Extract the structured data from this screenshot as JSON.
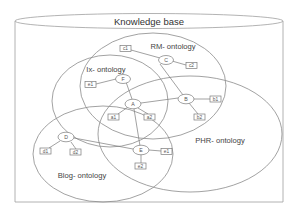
{
  "diagram": {
    "title": "Knowledge base",
    "ontologies": [
      {
        "id": "rm",
        "label": "RM- ontology"
      },
      {
        "id": "ix",
        "label": "Ix- ontology"
      },
      {
        "id": "phr",
        "label": "PHR- ontology"
      },
      {
        "id": "blog",
        "label": "Blog- ontology"
      }
    ],
    "nodes": [
      {
        "id": "C",
        "label": "C"
      },
      {
        "id": "F",
        "label": "F"
      },
      {
        "id": "A",
        "label": "A"
      },
      {
        "id": "B",
        "label": "B"
      },
      {
        "id": "D",
        "label": "D"
      },
      {
        "id": "E",
        "label": "E"
      }
    ],
    "attributes": [
      {
        "id": "c1",
        "label": "c1",
        "parent": "C"
      },
      {
        "id": "c2",
        "label": "c2",
        "parent": "C"
      },
      {
        "id": "e1_f",
        "label": "e1",
        "parent": "F"
      },
      {
        "id": "a1",
        "label": "a1",
        "parent": "A"
      },
      {
        "id": "a2",
        "label": "a2",
        "parent": "A"
      },
      {
        "id": "b1",
        "label": "b1",
        "parent": "B"
      },
      {
        "id": "b2",
        "label": "b2",
        "parent": "B"
      },
      {
        "id": "d1",
        "label": "d1",
        "parent": "D"
      },
      {
        "id": "d2",
        "label": "d2",
        "parent": "D"
      },
      {
        "id": "e1_e",
        "label": "e1",
        "parent": "E"
      },
      {
        "id": "e2",
        "label": "e2",
        "parent": "E"
      }
    ],
    "edges": [
      [
        "C",
        "B"
      ],
      [
        "F",
        "A"
      ],
      [
        "A",
        "B"
      ],
      [
        "A",
        "E"
      ],
      [
        "D",
        "E"
      ]
    ]
  }
}
